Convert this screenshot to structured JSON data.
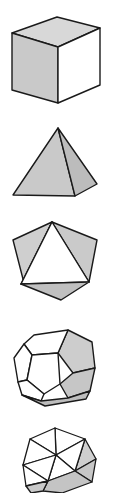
{
  "figure": {
    "name": "platonic-solids-column",
    "background_color": "#ffffff",
    "width": 113,
    "height": 493,
    "palette": {
      "outline": "#1a1a1a",
      "face_white": "#ffffff",
      "face_light": "#e2e2e2",
      "face_mid": "#c9c9c9",
      "face_dark": "#b3b3b3",
      "face_shadow": "#9d9d9d"
    },
    "solids": [
      {
        "id": "cube",
        "label": "Cube",
        "faces": 6,
        "face_shape": "square",
        "shading": {
          "top": "#d8d8d8",
          "left": "#c9c9c9",
          "right": "#ffffff"
        }
      },
      {
        "id": "tetrahedron",
        "label": "Tetrahedron",
        "faces": 4,
        "face_shape": "triangle",
        "shading": {
          "left": "#c9c9c9",
          "right": "#bcbcbc"
        }
      },
      {
        "id": "octahedron",
        "label": "Octahedron",
        "faces": 8,
        "face_shape": "triangle",
        "shading": {
          "front": "#ffffff",
          "left": "#cfcfcf",
          "right": "#cacaca",
          "bottom": "#c0c0c0"
        }
      },
      {
        "id": "dodecahedron",
        "label": "Dodecahedron",
        "faces": 12,
        "face_shape": "pentagon",
        "shading": {
          "front": "#ffffff",
          "right": "#cdcdcd",
          "bottom": "#bdbdbd"
        }
      },
      {
        "id": "icosahedron",
        "label": "Icosahedron",
        "faces": 20,
        "face_shape": "triangle",
        "shading": {
          "front": "#ffffff",
          "right": "#cfcfcf",
          "bottom": "#c4c4c4"
        }
      }
    ]
  }
}
